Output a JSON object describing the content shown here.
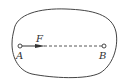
{
  "diagram": {
    "points": [
      {
        "label": "A",
        "x": 20,
        "y": 46
      },
      {
        "label": "B",
        "x": 104,
        "y": 46
      }
    ],
    "force": {
      "label": "F",
      "from": "A",
      "direction": "toward B"
    },
    "connector": {
      "style": "dashed",
      "from": "A",
      "to": "B"
    },
    "boundary": "closed irregular curve",
    "colors": {
      "stroke": "#444444",
      "background": "#ffffff"
    }
  }
}
